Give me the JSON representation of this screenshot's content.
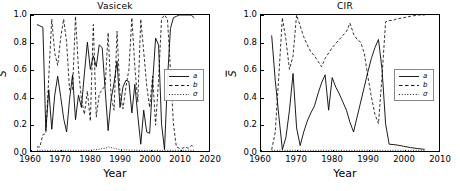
{
  "figure": {
    "xlabel": "Year",
    "ylabel": "S"
  },
  "panels": [
    {
      "id": "vasicek",
      "title": "Vasicek",
      "xlabel": "Year",
      "ylabel": "S",
      "xticks": [
        "1960",
        "1970",
        "1980",
        "1990",
        "2000",
        "2010",
        "2020"
      ],
      "yticks": [
        "0.0",
        "0.2",
        "0.4",
        "0.6",
        "0.8",
        "1.0"
      ],
      "legend": [
        {
          "label": "a",
          "style": "solid"
        },
        {
          "label": "b",
          "style": "dashed"
        },
        {
          "label": "σ",
          "style": "dotted"
        }
      ]
    },
    {
      "id": "cir",
      "title": "CIR",
      "xlabel": "Year",
      "ylabel": "S",
      "xticks": [
        "1960",
        "1970",
        "1980",
        "1990",
        "2000",
        "2010"
      ],
      "yticks": [
        "0.0",
        "0.2",
        "0.4",
        "0.6",
        "0.8",
        "1.0"
      ],
      "legend": [
        {
          "label": "a",
          "style": "solid"
        },
        {
          "label": "b",
          "style": "dashed"
        },
        {
          "label": "σ",
          "style": "dotted"
        }
      ]
    }
  ],
  "chart_data": [
    {
      "type": "line",
      "title": "Vasicek",
      "xlabel": "Year",
      "ylabel": "S",
      "xlim": [
        1960,
        2020
      ],
      "ylim": [
        0.0,
        1.0
      ],
      "grid": false,
      "legend_position": "center-right",
      "series": [
        {
          "name": "a",
          "style": "solid",
          "color": "#000000",
          "x": [
            1962,
            1963,
            1964,
            1965,
            1966,
            1967,
            1968,
            1969,
            1970,
            1971,
            1972,
            1973,
            1974,
            1975,
            1976,
            1977,
            1978,
            1979,
            1980,
            1981,
            1982,
            1983,
            1984,
            1985,
            1986,
            1987,
            1988,
            1989,
            1990,
            1991,
            1992,
            1993,
            1994,
            1995,
            1996,
            1997,
            1998,
            1999,
            2000,
            2001,
            2002,
            2003,
            2004,
            2005,
            2006,
            2007,
            2008,
            2009,
            2010,
            2011,
            2012,
            2013,
            2014,
            2015
          ],
          "y": [
            0.93,
            0.92,
            0.91,
            0.15,
            0.45,
            0.16,
            0.41,
            0.55,
            0.4,
            0.24,
            0.14,
            0.38,
            0.56,
            0.23,
            0.41,
            0.32,
            0.57,
            0.8,
            0.6,
            0.7,
            0.62,
            0.78,
            0.76,
            0.45,
            0.15,
            0.38,
            0.5,
            0.66,
            0.32,
            0.47,
            0.52,
            0.51,
            0.28,
            0.49,
            0.26,
            0.05,
            0.3,
            0.14,
            0.13,
            0.5,
            0.83,
            0.78,
            0.2,
            0.01,
            0.52,
            0.9,
            0.98,
            0.99,
            1.0,
            1.0,
            1.0,
            1.0,
            1.0,
            0.98
          ]
        },
        {
          "name": "b",
          "style": "dashed",
          "color": "#000000",
          "x": [
            1962,
            1963,
            1964,
            1965,
            1966,
            1967,
            1968,
            1969,
            1970,
            1971,
            1972,
            1973,
            1974,
            1975,
            1976,
            1977,
            1978,
            1979,
            1980,
            1981,
            1982,
            1983,
            1984,
            1985,
            1986,
            1987,
            1988,
            1989,
            1990,
            1991,
            1992,
            1993,
            1994,
            1995,
            1996,
            1997,
            1998,
            1999,
            2000,
            2001,
            2002,
            2003,
            2004,
            2005,
            2006,
            2007,
            2008,
            2009,
            2010,
            2011,
            2012,
            2013,
            2014,
            2015
          ],
          "y": [
            0.03,
            0.03,
            0.12,
            0.13,
            0.55,
            0.97,
            0.72,
            0.63,
            0.83,
            0.97,
            0.8,
            0.45,
            0.45,
            0.99,
            0.6,
            0.38,
            0.27,
            0.44,
            0.22,
            0.93,
            0.25,
            0.42,
            0.45,
            0.48,
            0.87,
            0.4,
            0.3,
            0.88,
            0.42,
            0.31,
            0.47,
            0.6,
            0.98,
            0.62,
            0.36,
            0.97,
            0.73,
            0.48,
            0.32,
            0.55,
            0.19,
            0.52,
            0.97,
            1.0,
            0.97,
            0.6,
            0.2,
            0.03,
            0.02,
            0.02,
            0.03,
            0.02,
            0.04,
            0.03
          ]
        },
        {
          "name": "σ",
          "style": "dotted",
          "color": "#000000",
          "x": [
            1962,
            1965,
            1970,
            1975,
            1980,
            1985,
            1986,
            1990,
            1995,
            2000,
            2005,
            2010,
            2015
          ],
          "y": [
            0.005,
            0.005,
            0.005,
            0.005,
            0.005,
            0.02,
            0.03,
            0.01,
            0.005,
            0.005,
            0.005,
            0.005,
            0.005
          ]
        }
      ]
    },
    {
      "type": "line",
      "title": "CIR",
      "xlabel": "Year",
      "ylabel": "S",
      "xlim": [
        1960,
        2010
      ],
      "ylim": [
        0.0,
        1.0
      ],
      "grid": false,
      "legend_position": "center-right",
      "series": [
        {
          "name": "a",
          "style": "solid",
          "color": "#000000",
          "x": [
            1963,
            1964,
            1965,
            1966,
            1967,
            1968,
            1969,
            1970,
            1971,
            1972,
            1973,
            1974,
            1975,
            1976,
            1977,
            1978,
            1979,
            1980,
            1981,
            1982,
            1983,
            1984,
            1985,
            1986,
            1987,
            1988,
            1989,
            1990,
            1991,
            1992,
            1993,
            1994,
            1995,
            1996,
            1998,
            2000,
            2002,
            2004,
            2006
          ],
          "y": [
            0.85,
            0.52,
            0.26,
            0.01,
            0.1,
            0.3,
            0.57,
            0.17,
            0.04,
            0.14,
            0.22,
            0.28,
            0.33,
            0.42,
            0.5,
            0.56,
            0.3,
            0.54,
            0.47,
            0.42,
            0.36,
            0.3,
            0.21,
            0.14,
            0.25,
            0.36,
            0.47,
            0.58,
            0.68,
            0.76,
            0.82,
            0.6,
            0.2,
            0.05,
            0.045,
            0.035,
            0.025,
            0.018,
            0.012
          ]
        },
        {
          "name": "b",
          "style": "dashed",
          "color": "#000000",
          "x": [
            1963,
            1964,
            1965,
            1966,
            1967,
            1968,
            1969,
            1970,
            1971,
            1972,
            1973,
            1974,
            1975,
            1976,
            1977,
            1978,
            1979,
            1980,
            1981,
            1982,
            1983,
            1984,
            1985,
            1986,
            1987,
            1988,
            1989,
            1990,
            1991,
            1992,
            1993,
            1994,
            1995,
            1996,
            1997,
            1998,
            2000,
            2002,
            2004,
            2006
          ],
          "y": [
            0.01,
            0.14,
            0.55,
            0.98,
            0.82,
            0.6,
            0.7,
            1.0,
            0.92,
            0.84,
            0.78,
            0.73,
            0.7,
            0.66,
            0.62,
            0.68,
            0.72,
            0.76,
            0.79,
            0.82,
            0.85,
            0.88,
            0.94,
            0.86,
            0.82,
            0.8,
            0.72,
            0.55,
            0.4,
            0.27,
            0.2,
            0.55,
            0.95,
            0.96,
            0.96,
            0.97,
            0.98,
            0.99,
            1.0,
            1.0
          ]
        },
        {
          "name": "σ",
          "style": "dotted",
          "color": "#000000",
          "x": [
            1963,
            1966,
            1970,
            1975,
            1980,
            1985,
            1990,
            1995,
            2000,
            2006
          ],
          "y": [
            0.005,
            0.005,
            0.005,
            0.005,
            0.005,
            0.005,
            0.005,
            0.005,
            0.005,
            0.005
          ]
        }
      ]
    }
  ]
}
